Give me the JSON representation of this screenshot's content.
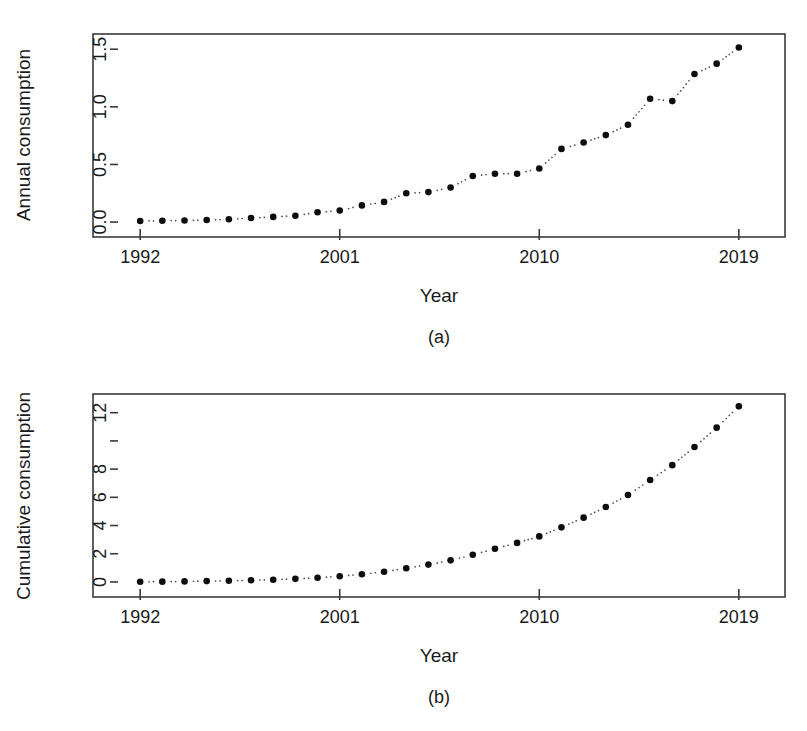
{
  "figure": {
    "background_color": "#ffffff",
    "point_color": "#0d0d0d",
    "axis_color": "#3a3a3a"
  },
  "panel_a": {
    "caption": "(a)",
    "xlabel": "Year",
    "ylabel": "Annual consumption",
    "y_tick_labels": [
      "0.0",
      "0.5",
      "1.0",
      "1.5"
    ],
    "x_tick_labels": [
      "1992",
      "2001",
      "2010",
      "2019"
    ]
  },
  "panel_b": {
    "caption": "(b)",
    "xlabel": "Year",
    "ylabel": "Cumulative consumption",
    "y_tick_labels": [
      "0",
      "2",
      "4",
      "6",
      "8",
      "",
      "12"
    ],
    "x_tick_labels": [
      "1992",
      "2001",
      "2010",
      "2019"
    ]
  },
  "chart_data": [
    {
      "type": "scatter",
      "panel": "(a)",
      "title": "",
      "xlabel": "Year",
      "ylabel": "Annual consumption",
      "xlim": [
        1991.0,
        2020.0
      ],
      "ylim": [
        -0.06,
        1.58
      ],
      "xticks": [
        1992,
        2001,
        2010,
        2019
      ],
      "yticks": [
        0.0,
        0.5,
        1.0,
        1.5
      ],
      "grid": false,
      "legend": null,
      "marker": "filled-circle",
      "connector": "dotted",
      "x": [
        1992,
        1993,
        1994,
        1995,
        1996,
        1997,
        1998,
        1999,
        2000,
        2001,
        2002,
        2003,
        2004,
        2005,
        2006,
        2007,
        2008,
        2009,
        2010,
        2011,
        2012,
        2013,
        2014,
        2015,
        2016,
        2017,
        2018,
        2019
      ],
      "values": [
        0.01,
        0.012,
        0.014,
        0.018,
        0.025,
        0.035,
        0.045,
        0.055,
        0.085,
        0.1,
        0.145,
        0.175,
        0.25,
        0.26,
        0.3,
        0.4,
        0.42,
        0.42,
        0.465,
        0.635,
        0.69,
        0.755,
        0.845,
        1.07,
        1.05,
        1.285,
        1.375,
        1.515
      ]
    },
    {
      "type": "scatter",
      "panel": "(b)",
      "title": "",
      "xlabel": "Year",
      "ylabel": "Cumulative consumption",
      "xlim": [
        1991.0,
        2020.0
      ],
      "ylim": [
        -0.5,
        12.9
      ],
      "xticks": [
        1992,
        2001,
        2010,
        2019
      ],
      "yticks": [
        0,
        2,
        4,
        6,
        8,
        10,
        12
      ],
      "grid": false,
      "legend": null,
      "marker": "filled-circle",
      "connector": "dotted",
      "x": [
        1992,
        1993,
        1994,
        1995,
        1996,
        1997,
        1998,
        1999,
        2000,
        2001,
        2002,
        2003,
        2004,
        2005,
        2006,
        2007,
        2008,
        2009,
        2010,
        2011,
        2012,
        2013,
        2014,
        2015,
        2016,
        2017,
        2018,
        2019
      ],
      "values": [
        0.01,
        0.02,
        0.04,
        0.06,
        0.08,
        0.12,
        0.16,
        0.22,
        0.3,
        0.4,
        0.55,
        0.72,
        0.97,
        1.23,
        1.53,
        1.93,
        2.35,
        2.77,
        3.23,
        3.87,
        4.56,
        5.31,
        6.16,
        7.23,
        8.28,
        9.57,
        10.94,
        12.45
      ]
    }
  ]
}
